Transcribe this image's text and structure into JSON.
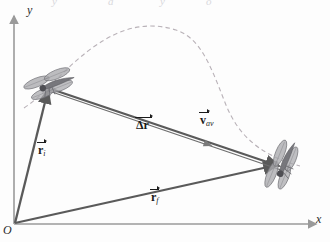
{
  "figure": {
    "type": "vector-diagram",
    "background_color": "#fdfdfd",
    "axes": {
      "x_label": "x",
      "y_label": "y",
      "origin_label": "O",
      "axis_color": "#9a9a9a",
      "x_axis": {
        "x1": 14,
        "y1": 224,
        "x2": 318,
        "y2": 224
      },
      "y_axis": {
        "x1": 14,
        "y1": 224,
        "x2": 14,
        "y2": 14
      }
    },
    "vectors": [
      {
        "name": "initial-position-vector",
        "label": "r",
        "subscript": "i",
        "label_x": 38,
        "label_y": 147,
        "color": "#5a5a5a",
        "from": {
          "x": 15,
          "y": 223
        },
        "to": {
          "x": 48,
          "y": 88
        },
        "description": "position vector from origin to dragonfly initial position"
      },
      {
        "name": "final-position-vector",
        "label": "r",
        "subscript": "f",
        "label_x": 151,
        "label_y": 194,
        "color": "#5a5a5a",
        "from": {
          "x": 15,
          "y": 223
        },
        "to": {
          "x": 279,
          "y": 165
        },
        "description": "position vector from origin to dragonfly final position"
      },
      {
        "name": "displacement-vector",
        "label": "Δr",
        "subscript": "",
        "label_x": 137,
        "label_y": 122,
        "color": "#5a5a5a",
        "from": {
          "x": 48,
          "y": 88
        },
        "to": {
          "x": 279,
          "y": 165
        },
        "description": "displacement vector delta r from initial to final position"
      },
      {
        "name": "average-velocity-vector",
        "label": "v",
        "subscript": "av",
        "label_x": 201,
        "label_y": 117,
        "color": "#6e6e6e",
        "from": {
          "x": 48,
          "y": 88
        },
        "to": {
          "x": 279,
          "y": 165
        },
        "description": "average velocity vector parallel to displacement"
      }
    ],
    "path": {
      "name": "trajectory-path",
      "style": "dashed",
      "color": "#b9b2b8",
      "description": "dashed curved flight path of the dragonfly"
    },
    "objects": [
      {
        "name": "dragonfly-initial",
        "x": 50,
        "y": 85,
        "rotation": -22,
        "scale": 1.0,
        "color": "#8c8c8c"
      },
      {
        "name": "dragonfly-final",
        "x": 283,
        "y": 166,
        "rotation": -70,
        "scale": 1.0,
        "color": "#8c8c8c"
      }
    ],
    "top_cutoff_text": "y"
  }
}
